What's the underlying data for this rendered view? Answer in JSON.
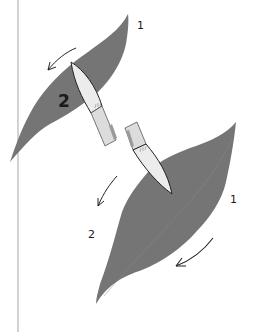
{
  "figure": {
    "colors": {
      "leaf": "#757575",
      "leaf_vein": "#8e8e8e",
      "brush_tip": "#ececec",
      "brush_ferrule": "#dcdcdc",
      "ferrule_shade": "#9a9a9a",
      "outline": "#222222",
      "margin_line": "#b5b5b5"
    },
    "top_leaf": {
      "stroke_1_label": "1",
      "stroke_2_label": "2"
    },
    "bottom_leaf": {
      "stroke_1_label": "1",
      "stroke_2_label": "2"
    }
  }
}
